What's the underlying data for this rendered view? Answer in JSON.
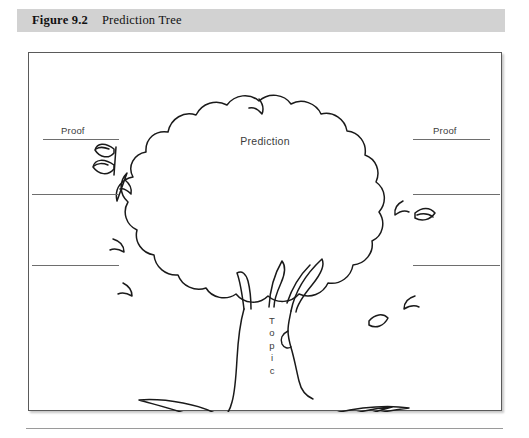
{
  "caption": {
    "number": "Figure 9.2",
    "title": "Prediction Tree"
  },
  "figure": {
    "prediction_label": "Prediction",
    "topic_label": "Topic",
    "topic_letters": [
      "T",
      "o",
      "p",
      "i",
      "c"
    ],
    "left_proof_label": "Proof",
    "right_proof_label": "Proof",
    "blank_lines_left": 3,
    "blank_lines_right": 3
  },
  "colors": {
    "banner_gray": "#d2d2d2",
    "frame_border": "#5a5a5a",
    "ink": "#1a1a1a",
    "text": "#3b3b3b",
    "rule": "#6e6e6e",
    "page_rule": "#9a9a9a",
    "paper": "#ffffff"
  }
}
